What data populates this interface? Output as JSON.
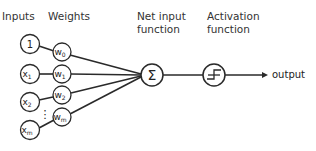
{
  "header": {
    "inputs_label": "Inputs",
    "weights_label": "Weights",
    "net_input_label_line1": "Net input",
    "net_input_label_line2": "function",
    "activation_label_line1": "Activation",
    "activation_label_line2": "function"
  },
  "inputs": [
    {
      "label": "1",
      "sub": ""
    },
    {
      "label": "x",
      "sub": "1"
    },
    {
      "label": "x",
      "sub": "2"
    },
    {
      "label": "x",
      "sub": "m"
    }
  ],
  "weights": [
    {
      "label": "w",
      "sub": "0"
    },
    {
      "label": "w",
      "sub": "1"
    },
    {
      "label": "w",
      "sub": "2"
    },
    {
      "label": "w",
      "sub": "m"
    }
  ],
  "ellipsis": "⋮",
  "net_input_symbol": "Σ",
  "activation_icon": "step-function-icon",
  "output_label": "output",
  "colors": {
    "stroke": "#2a2a2a",
    "background": "#ffffff"
  }
}
